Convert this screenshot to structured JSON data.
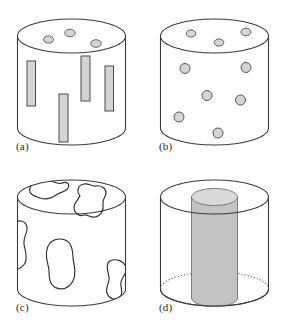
{
  "figure": {
    "background_color": "#ffffff",
    "outline_color": "#3a3a3a",
    "inclusion_fill": "#d4d4d4",
    "inclusion_stroke": "#555555",
    "label_color": "#2b2b2b",
    "width": 286,
    "height": 323
  },
  "panels": [
    {
      "id": "a",
      "label": "(a)",
      "name": "aligned-fiber-cylinder",
      "description": "Cylinder containing vertically aligned short rectangular fibers on the side wall and small ellipses on the top face",
      "cylinder": {
        "cx": 71.5,
        "top_cy": 36,
        "rx": 54,
        "ry": 17,
        "body_height": 92
      },
      "top_face_circles": [
        {
          "cx": 48.5,
          "cy": 39.5,
          "rx": 5.0,
          "ry": 3.6
        },
        {
          "cx": 70.0,
          "cy": 33.0,
          "rx": 5.2,
          "ry": 3.8
        },
        {
          "cx": 96.0,
          "cy": 43.5,
          "rx": 5.2,
          "ry": 3.8
        }
      ],
      "side_rectangles": [
        {
          "x": 27.0,
          "y": 61.0,
          "w": 8.5,
          "h": 45.0
        },
        {
          "x": 59.0,
          "y": 94.0,
          "w": 9.0,
          "h": 48.0
        },
        {
          "x": 81.0,
          "y": 56.0,
          "w": 9.0,
          "h": 45.0
        },
        {
          "x": 105.0,
          "y": 66.0,
          "w": 8.5,
          "h": 45.0
        }
      ]
    },
    {
      "id": "b",
      "label": "(b)",
      "name": "particulate-cylinder",
      "description": "Cylinder containing randomly dispersed spherical particles on the side wall and small ellipses on the top face",
      "cylinder": {
        "cx": 71.5,
        "top_cy": 36,
        "rx": 54,
        "ry": 17,
        "body_height": 92
      },
      "top_face_circles": [
        {
          "cx": 48.0,
          "cy": 33.5,
          "rx": 4.8,
          "ry": 3.6
        },
        {
          "cx": 76.0,
          "cy": 42.5,
          "rx": 4.8,
          "ry": 3.6
        },
        {
          "cx": 103.0,
          "cy": 32.0,
          "rx": 5.0,
          "ry": 3.8
        }
      ],
      "side_circles": [
        {
          "cx": 42.0,
          "cy": 68.5,
          "r": 5.0
        },
        {
          "cx": 103.0,
          "cy": 67.5,
          "r": 5.0
        },
        {
          "cx": 64.0,
          "cy": 95.5,
          "r": 5.0
        },
        {
          "cx": 97.5,
          "cy": 100.0,
          "r": 5.0
        },
        {
          "cx": 36.0,
          "cy": 117.0,
          "r": 5.0
        },
        {
          "cx": 75.0,
          "cy": 133.0,
          "r": 5.0
        }
      ]
    },
    {
      "id": "c",
      "label": "(c)",
      "name": "irregular-phase-cylinder",
      "description": "Cylinder containing large irregular unfilled blob-shaped regions spanning the top face and side wall",
      "cylinder": {
        "cx": 71.5,
        "top_cy": 36,
        "rx": 54,
        "ry": 17,
        "body_height": 92
      },
      "blob_count": 5
    },
    {
      "id": "d",
      "label": "(d)",
      "name": "concentric-core-cylinder",
      "description": "Transparent outer cylinder enclosing a shaded inner cylindrical core; the hidden bottom ellipse is drawn dotted",
      "cylinder": {
        "cx": 71.5,
        "top_cy": 36,
        "rx": 54,
        "ry": 17,
        "body_height": 92
      },
      "core": {
        "cx": 71.5,
        "top_cy": 36,
        "rx": 23,
        "ry": 8.5,
        "body_height": 101,
        "fill": "#c3c3c3",
        "top_fill": "#d9d9d9"
      }
    }
  ]
}
